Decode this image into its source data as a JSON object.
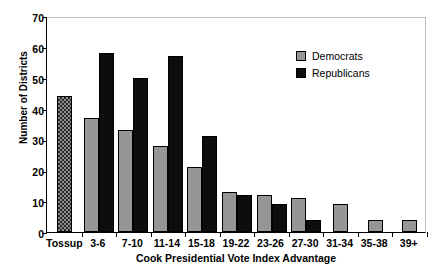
{
  "chart_data": {
    "type": "bar",
    "title": "",
    "xlabel": "Cook Presidential Vote Index Advantage",
    "ylabel": "Number of Districts",
    "ylim": [
      0,
      70
    ],
    "yticks": [
      0,
      10,
      20,
      30,
      40,
      50,
      60,
      70
    ],
    "grid": false,
    "legend_position": "top-right",
    "categories": [
      "Tossup",
      "3-6",
      "7-10",
      "11-14",
      "15-18",
      "19-22",
      "23-26",
      "27-30",
      "31-34",
      "35-38",
      "39+"
    ],
    "series": [
      {
        "name": "Tossup",
        "style": "checkered",
        "values": [
          44,
          null,
          null,
          null,
          null,
          null,
          null,
          null,
          null,
          null,
          null
        ]
      },
      {
        "name": "Democrats",
        "style": "gray",
        "values": [
          null,
          37,
          33,
          28,
          21,
          13,
          12,
          11,
          9,
          4,
          4
        ]
      },
      {
        "name": "Republicans",
        "style": "black",
        "values": [
          null,
          58,
          50,
          57,
          31,
          12,
          9,
          4,
          null,
          null,
          null
        ]
      }
    ],
    "colors": {
      "democrats": "#969696",
      "republicans": "#0d0d0d",
      "tossup": "#8c8c8c",
      "axis": "#000000",
      "frame": "#bdbdbd"
    }
  },
  "legend": {
    "entries": [
      {
        "label": "Democrats",
        "swatch": "dem"
      },
      {
        "label": "Republicans",
        "swatch": "rep"
      }
    ]
  }
}
